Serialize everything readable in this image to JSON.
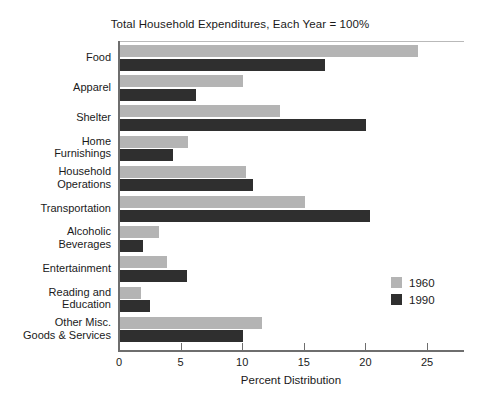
{
  "chart_data": {
    "type": "bar",
    "orientation": "horizontal",
    "title": "Total Household Expenditures, Each Year = 100%",
    "xlabel": "Percent Distribution",
    "ylabel": "",
    "xlim": [
      0,
      25
    ],
    "xticks": [
      0,
      5,
      10,
      15,
      20,
      25
    ],
    "xtick_labels": [
      "0",
      "5",
      "10",
      "15",
      "20",
      "25"
    ],
    "grid": false,
    "legend_position": "right",
    "categories": [
      "Food",
      "Apparel",
      "Shelter",
      "Home\nFurnishings",
      "Household\nOperations",
      "Transportation",
      "Alcoholic\nBeverages",
      "Entertainment",
      "Reading and\nEducation",
      "Other Misc.\nGoods & Services"
    ],
    "series": [
      {
        "name": "1960",
        "color": "#b4b4b4",
        "values": [
          24.2,
          10.0,
          13.0,
          5.5,
          10.2,
          15.0,
          3.2,
          3.8,
          1.7,
          11.5
        ]
      },
      {
        "name": "1990",
        "color": "#2f2f2f",
        "values": [
          16.6,
          6.2,
          20.0,
          4.3,
          10.8,
          20.3,
          1.9,
          5.4,
          2.4,
          10.0
        ]
      }
    ]
  }
}
